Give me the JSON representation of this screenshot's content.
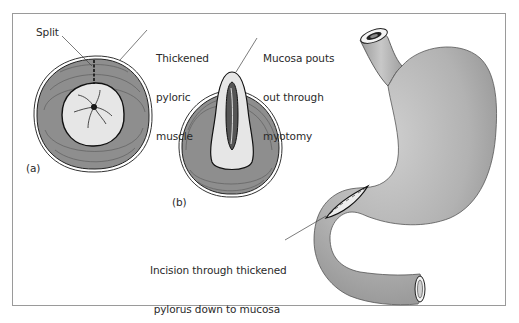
{
  "figure": {
    "panels": [
      {
        "id": "a",
        "label": "(a)",
        "description": "Cross-section of thickened pyloric muscle with split"
      },
      {
        "id": "b",
        "label": "(b)",
        "description": "Cross-section after myotomy with mucosa pouting out"
      },
      {
        "id": "c",
        "description": "Stomach with incision through thickened pylorus"
      }
    ],
    "annotations": {
      "split": "Split",
      "thickened_line1": "Thickened",
      "thickened_line2": "pyloric",
      "thickened_line3": "muscle",
      "mucosa_line1": "Mucosa pouts",
      "mucosa_line2": "out through",
      "mucosa_line3": "myotomy",
      "incision_line1": "Incision through thickened",
      "incision_line2": "pylorus down to mucosa"
    },
    "colors": {
      "muscle": "#8e8e8e",
      "mucosa": "#e6e6e6",
      "stomach": "#b3b3b3",
      "frame": "#9a9a9a",
      "text": "#2a2a2a"
    }
  }
}
